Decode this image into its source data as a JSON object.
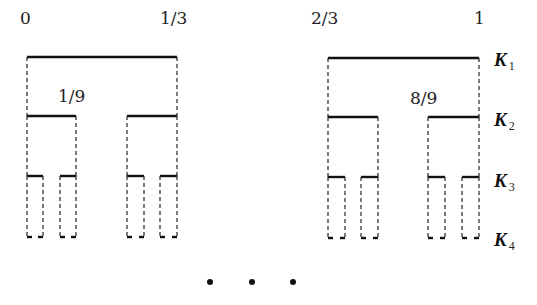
{
  "diagram": {
    "endpoint_labels": {
      "zero": "0",
      "one_third": "1/3",
      "two_thirds": "2/3",
      "one": "1",
      "one_ninth": "1/9",
      "eight_ninths": "8/9"
    },
    "levels": [
      {
        "name": "K",
        "sub": "1"
      },
      {
        "name": "K",
        "sub": "2"
      },
      {
        "name": "K",
        "sub": "3"
      },
      {
        "name": "K",
        "sub": "4"
      }
    ],
    "ellipsis": [
      "•",
      "•",
      "•"
    ],
    "colors": {
      "line": "#111111",
      "dash": "#333333",
      "background": "#ffffff"
    }
  }
}
